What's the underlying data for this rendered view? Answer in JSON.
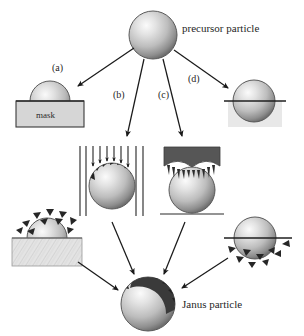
{
  "figure": {
    "background_color": "#ffffff",
    "labels": {
      "precursor": "precursor particle",
      "janus": "Janus particle",
      "mask": "mask"
    },
    "routes": [
      {
        "id": "a",
        "label": "(a)",
        "x": 58,
        "y": 68
      },
      {
        "id": "b",
        "label": "(b)",
        "x": 115,
        "y": 94
      },
      {
        "id": "c",
        "label": "(c)",
        "x": 158,
        "y": 94
      },
      {
        "id": "d",
        "label": "(d)",
        "x": 188,
        "y": 78
      }
    ],
    "colors": {
      "sphere_highlight": "#f4f4f4",
      "sphere_mid": "#b8b8b8",
      "sphere_edge": "#6f6f6f",
      "sphere_outline": "#4a4a4a",
      "mask_fill": "#d6d6d6",
      "mask_outline": "#3a3a3a",
      "substrate_fill": "#e3e3e3",
      "stamp_fill": "#565656",
      "coating_dark": "#2b2b2b",
      "arrow": "#1a1a1a"
    },
    "nodes": {
      "precursor_particle": {
        "cx": 153,
        "cy": 35,
        "r": 24
      },
      "route_a_result": {
        "cx": 50,
        "cy": 101,
        "r": 20,
        "type": "hemisphere-on-mask"
      },
      "route_b_process": {
        "cx": 112,
        "cy": 186,
        "r": 23,
        "type": "directional-deposition"
      },
      "route_c_process": {
        "cx": 192,
        "cy": 190,
        "r": 23,
        "type": "stamp-contact"
      },
      "route_d_result": {
        "cx": 254,
        "cy": 101,
        "r": 21,
        "type": "half-embedded-sphere"
      },
      "route_a_deposition": {
        "cx": 47,
        "cy": 238,
        "r": 20,
        "type": "hemisphere-masked-deposition"
      },
      "route_d_deposition": {
        "cx": 255,
        "cy": 238,
        "r": 21,
        "type": "embedded-sphere-deposition"
      },
      "janus_particle": {
        "cx": 148,
        "cy": 304,
        "r": 27
      }
    },
    "arrow_count_convergent": 4,
    "deposition_beam_count": 10
  }
}
